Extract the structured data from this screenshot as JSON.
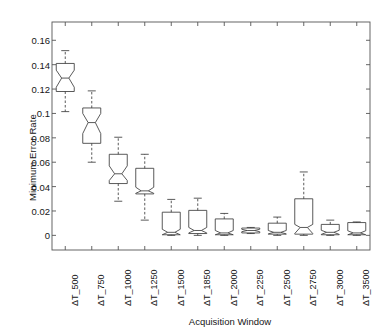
{
  "chart_data": {
    "type": "box",
    "title": "",
    "xlabel": "Acquisition Window",
    "ylabel": "Minimum Error Rate",
    "grid": false,
    "notched": true,
    "ylim": [
      -0.012,
      0.175
    ],
    "yticks": [
      0,
      0.02,
      0.04,
      0.06,
      0.08,
      0.1,
      0.12,
      0.14,
      0.16
    ],
    "ytick_labels": [
      "0",
      "0.02",
      "0.04",
      "0.06",
      "0.08",
      "0.1",
      "0.12",
      "0.14",
      "0.16"
    ],
    "categories": [
      "ΔT_500",
      "ΔT_750",
      "ΔT_1000",
      "ΔT_1250",
      "ΔT_1500",
      "ΔT_1850",
      "ΔT_2000",
      "ΔT_2250",
      "ΔT_2500",
      "ΔT_2750",
      "ΔT_3000",
      "ΔT_3500"
    ],
    "boxes": [
      {
        "category": "ΔT_500",
        "whisker_low": 0.1015,
        "q1": 0.118,
        "median": 0.129,
        "q3": 0.141,
        "whisker_high": 0.1515,
        "notch_low": 0.1215,
        "notch_high": 0.1355
      },
      {
        "category": "ΔT_750",
        "whisker_low": 0.06,
        "q1": 0.0755,
        "median": 0.0925,
        "q3": 0.1045,
        "whisker_high": 0.1185,
        "notch_low": 0.0835,
        "notch_high": 0.1
      },
      {
        "category": "ΔT_1000",
        "whisker_low": 0.028,
        "q1": 0.0425,
        "median": 0.0505,
        "q3": 0.0665,
        "whisker_high": 0.0805,
        "notch_low": 0.045,
        "notch_high": 0.057
      },
      {
        "category": "ΔT_1250",
        "whisker_low": 0.0125,
        "q1": 0.034,
        "median": 0.0365,
        "q3": 0.055,
        "whisker_high": 0.0665,
        "notch_low": 0.0345,
        "notch_high": 0.0395
      },
      {
        "category": "ΔT_1500",
        "whisker_low": 0.0,
        "q1": 0.0005,
        "median": 0.0025,
        "q3": 0.019,
        "whisker_high": 0.0295,
        "notch_low": 0.0005,
        "notch_high": 0.005
      },
      {
        "category": "ΔT_1850",
        "whisker_low": 0.0,
        "q1": 0.0015,
        "median": 0.004,
        "q3": 0.0205,
        "whisker_high": 0.0305,
        "notch_low": 0.002,
        "notch_high": 0.0065
      },
      {
        "category": "ΔT_2000",
        "whisker_low": 0.0,
        "q1": 0.0005,
        "median": 0.002,
        "q3": 0.0135,
        "whisker_high": 0.018,
        "notch_low": 0.0005,
        "notch_high": 0.004
      },
      {
        "category": "ΔT_2250",
        "whisker_low": 0.0015,
        "q1": 0.002,
        "median": 0.004,
        "q3": 0.006,
        "whisker_high": 0.0065,
        "notch_low": 0.003,
        "notch_high": 0.005
      },
      {
        "category": "ΔT_2500",
        "whisker_low": 0.0,
        "q1": 0.001,
        "median": 0.0025,
        "q3": 0.01,
        "whisker_high": 0.015,
        "notch_low": 0.0012,
        "notch_high": 0.004
      },
      {
        "category": "ΔT_2750",
        "whisker_low": 0.0,
        "q1": 0.001,
        "median": 0.0065,
        "q3": 0.03,
        "whisker_high": 0.052,
        "notch_low": 0.0015,
        "notch_high": 0.009
      },
      {
        "category": "ΔT_3000",
        "whisker_low": 0.0,
        "q1": 0.0005,
        "median": 0.0025,
        "q3": 0.009,
        "whisker_high": 0.0125,
        "notch_low": 0.0008,
        "notch_high": 0.0042
      },
      {
        "category": "ΔT_3500",
        "whisker_low": 0.0,
        "q1": 0.0005,
        "median": 0.002,
        "q3": 0.0105,
        "whisker_high": 0.011,
        "notch_low": 0.0005,
        "notch_high": 0.0038
      }
    ]
  },
  "colors": {
    "line": "#3c3c3c",
    "axis": "#555555",
    "text": "#161616",
    "background": "#ffffff"
  }
}
